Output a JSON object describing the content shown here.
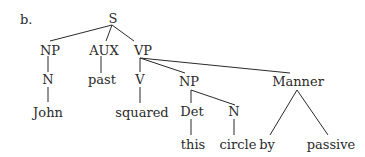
{
  "label": "b.",
  "nodes": {
    "S": "S",
    "NP_subj": "NP",
    "AUX": "AUX",
    "VP": "VP",
    "N_subj": "N",
    "past": "past",
    "V": "V",
    "NP_obj": "NP",
    "Manner": "Manner",
    "John": "John",
    "squared": "squared",
    "Det": "Det",
    "N_obj": "N",
    "this": "this",
    "circle": "circle",
    "by": "by",
    "passive": "passive"
  },
  "structure": {
    "S": [
      "NP_subj",
      "AUX",
      "VP"
    ],
    "NP_subj": [
      "N_subj"
    ],
    "N_subj": [
      "John"
    ],
    "AUX": [
      "past"
    ],
    "VP": [
      "V",
      "NP_obj",
      "Manner"
    ],
    "V": [
      "squared"
    ],
    "NP_obj": [
      "Det",
      "N_obj"
    ],
    "Det": [
      "this"
    ],
    "N_obj": [
      "circle"
    ],
    "Manner": [
      "by",
      "passive"
    ]
  }
}
